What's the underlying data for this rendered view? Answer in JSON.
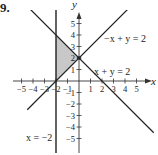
{
  "problem": {
    "number": "9."
  },
  "chart_data": {
    "type": "line",
    "title": "",
    "xlabel": "x",
    "ylabel": "y",
    "xlim": [
      -5,
      5
    ],
    "ylim": [
      -5,
      5
    ],
    "x_ticks": [
      -5,
      -4,
      -3,
      -2,
      -1,
      1,
      2,
      3,
      4,
      5
    ],
    "y_ticks": [
      -5,
      -4,
      -3,
      -2,
      -1,
      1,
      2,
      3,
      4,
      5
    ],
    "x_tick_labels": [
      "-5",
      "-4",
      "-3",
      "-2",
      "-1",
      "1",
      "2",
      "3",
      "4",
      "5"
    ],
    "y_tick_labels": [
      "-5",
      "-4",
      "-3",
      "-2",
      "-1",
      "1",
      "2",
      "3",
      "4",
      "5"
    ],
    "grid": false,
    "series": [
      {
        "name": "-x + y = 2",
        "label": "−x + y = 2",
        "equation": "y = x + 2",
        "x": [
          -4.5,
          5
        ],
        "y": [
          -2.5,
          7
        ]
      },
      {
        "name": "x + y = 2",
        "label": "x + y = 2",
        "equation": "y = -x + 2",
        "x": [
          -5,
          6.5
        ],
        "y": [
          7,
          -4.5
        ]
      },
      {
        "name": "x = -2",
        "label": "x = −2",
        "equation": "x = -2",
        "x": [
          -2,
          -2
        ],
        "y": [
          -6.5,
          6.5
        ]
      }
    ],
    "shaded_region": {
      "vertices": [
        [
          -2,
          0
        ],
        [
          -2,
          4
        ],
        [
          0,
          2
        ]
      ],
      "color": "#c8c8c8"
    },
    "points": [
      {
        "x": 0,
        "y": 2
      }
    ],
    "annotations": [
      "−x + y = 2",
      "x + y = 2",
      "x = −2"
    ]
  },
  "labels": {
    "x_axis": "x",
    "y_axis": "y",
    "line1": "−x + y = 2",
    "line2": "x + y = 2",
    "line3": "x = −2"
  },
  "ticks": {
    "x": [
      {
        "v": -5,
        "t": "−5"
      },
      {
        "v": -4,
        "t": "−4"
      },
      {
        "v": -3,
        "t": "−3"
      },
      {
        "v": -2,
        "t": "−2"
      },
      {
        "v": -1,
        "t": "−1"
      },
      {
        "v": 1,
        "t": "1"
      },
      {
        "v": 2,
        "t": "2"
      },
      {
        "v": 3,
        "t": "3"
      },
      {
        "v": 4,
        "t": "4"
      },
      {
        "v": 5,
        "t": "5"
      }
    ],
    "y": [
      {
        "v": 5,
        "t": "5"
      },
      {
        "v": 4,
        "t": "4"
      },
      {
        "v": 3,
        "t": "3"
      },
      {
        "v": 2,
        "t": "2"
      },
      {
        "v": 1,
        "t": "1"
      },
      {
        "v": -1,
        "t": "−1"
      },
      {
        "v": -2,
        "t": "−2"
      },
      {
        "v": -3,
        "t": "−3"
      },
      {
        "v": -4,
        "t": "−4"
      },
      {
        "v": -5,
        "t": "−5"
      }
    ]
  },
  "colors": {
    "line": "#222222",
    "shade": "#c8c8c8",
    "axis": "#333333"
  }
}
